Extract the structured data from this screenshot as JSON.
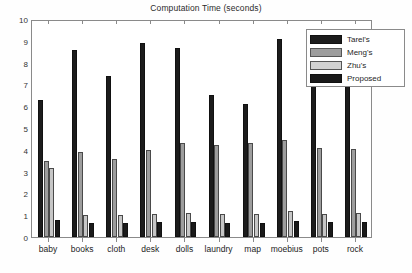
{
  "chart_data": {
    "type": "bar",
    "title": "Computation Time (seconds)",
    "xlabel": "",
    "ylabel": "",
    "ylim": [
      0,
      10
    ],
    "yticks": [
      0,
      1,
      2,
      3,
      4,
      5,
      6,
      7,
      8,
      9,
      10
    ],
    "grid": false,
    "legend_position": "top-right",
    "categories": [
      "baby",
      "books",
      "cloth",
      "desk",
      "dolls",
      "laundry",
      "map",
      "moebius",
      "pots",
      "rock"
    ],
    "series": [
      {
        "name": "Tarel's",
        "color": "#1c1c1c",
        "values": [
          6.3,
          8.6,
          7.4,
          8.9,
          8.65,
          6.5,
          6.1,
          9.1,
          7.1,
          8.1
        ]
      },
      {
        "name": "Meng's",
        "color": "#9d9d9d",
        "values": [
          3.5,
          3.9,
          3.6,
          4.0,
          4.3,
          4.2,
          4.3,
          4.45,
          4.1,
          4.05
        ]
      },
      {
        "name": "Zhu's",
        "color": "#d2d2d2",
        "values": [
          3.15,
          1.0,
          1.0,
          1.05,
          1.1,
          1.05,
          1.05,
          1.2,
          1.05,
          1.1
        ]
      },
      {
        "name": "Proposed",
        "color": "#1a1a1a",
        "values": [
          0.8,
          0.62,
          0.65,
          0.68,
          0.7,
          0.66,
          0.66,
          0.72,
          0.68,
          0.68
        ]
      }
    ]
  },
  "legend": {
    "items": [
      {
        "label": "Tarel's"
      },
      {
        "label": "Meng's"
      },
      {
        "label": "Zhu's"
      },
      {
        "label": "Proposed"
      }
    ]
  }
}
